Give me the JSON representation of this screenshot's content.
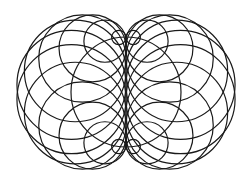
{
  "diagram": {
    "kind": "circle-envelope (nephroid construction)",
    "width": 252,
    "height": 183,
    "background": "#ffffff",
    "stroke_color": "#1a1a1a",
    "stroke_width": 1.2,
    "center": [
      126,
      92
    ],
    "base_circle_radius_x": 55,
    "base_circle_radius_y": 55,
    "circle_count": 24,
    "show_base_circle": true
  }
}
